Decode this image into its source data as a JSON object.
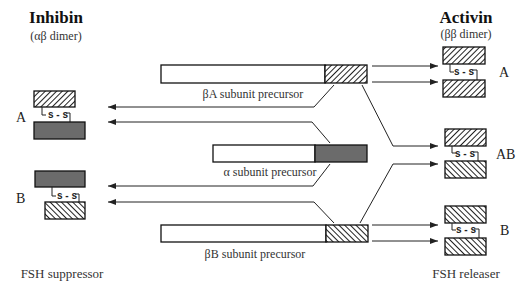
{
  "diagram": {
    "left_header": {
      "title": "Inhibin",
      "subtitle": "(αβ dimer)"
    },
    "right_header": {
      "title": "Activin",
      "subtitle": "(ββ dimer)"
    },
    "precursors": [
      {
        "id": "betaA",
        "label": "βA subunit precursor",
        "tail_fill": "hatch-forward"
      },
      {
        "id": "alpha",
        "label": "α subunit precursor",
        "tail_fill": "solid-dark"
      },
      {
        "id": "betaB",
        "label": "βB subunit precursor",
        "tail_fill": "hatch-back"
      }
    ],
    "inhibin_forms": [
      {
        "letter": "A",
        "top": "βA",
        "bottom": "α",
        "bond": "s - s"
      },
      {
        "letter": "B",
        "top": "α",
        "bottom": "βB",
        "bond": "s - s"
      }
    ],
    "activin_forms": [
      {
        "letter": "A",
        "top": "βA",
        "bottom": "βA",
        "bond": "s - s"
      },
      {
        "letter": "AB",
        "top": "βA",
        "bottom": "βB",
        "bond": "s - s"
      },
      {
        "letter": "B",
        "top": "βB",
        "bottom": "βB",
        "bond": "s - s"
      }
    ],
    "left_footer": "FSH suppressor",
    "right_footer": "FSH releaser",
    "colors": {
      "dark_fill": "#6b6b6b",
      "stroke": "#111111",
      "background": "#ffffff"
    }
  }
}
